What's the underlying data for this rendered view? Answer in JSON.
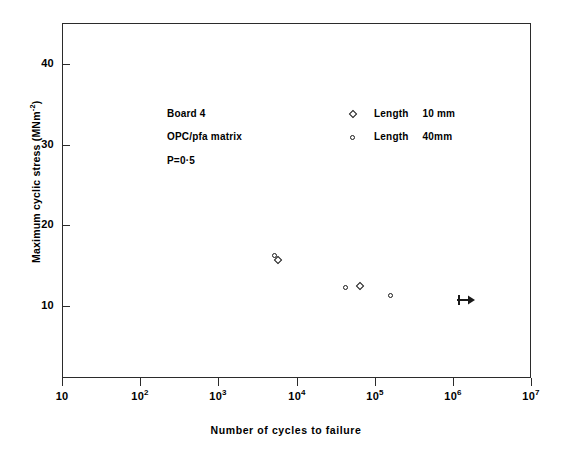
{
  "chart_data": {
    "type": "scatter",
    "title": "",
    "xlabel": "Number of cycles to failure",
    "ylabel": "Maximum cyclic stress (MNm⁻²)",
    "xscale": "log",
    "xlim": [
      10,
      10000000
    ],
    "ylim": [
      5.5,
      45.5
    ],
    "grid": false,
    "xticks": [
      {
        "value": 10,
        "label": "10",
        "mantissa": "10",
        "exponent": ""
      },
      {
        "value": 100,
        "label": "10²",
        "mantissa": "10",
        "exponent": "2"
      },
      {
        "value": 1000,
        "label": "10³",
        "mantissa": "10",
        "exponent": "3"
      },
      {
        "value": 10000,
        "label": "10⁴",
        "mantissa": "10",
        "exponent": "4"
      },
      {
        "value": 100000,
        "label": "10⁵",
        "mantissa": "10",
        "exponent": "5"
      },
      {
        "value": 1000000,
        "label": "10⁶",
        "mantissa": "10",
        "exponent": "6"
      },
      {
        "value": 10000000,
        "label": "10⁷",
        "mantissa": "10",
        "exponent": "7"
      }
    ],
    "yticks": [
      {
        "value": 10,
        "label": "10"
      },
      {
        "value": 20,
        "label": "20"
      },
      {
        "value": 30,
        "label": "30"
      },
      {
        "value": 40,
        "label": "40"
      }
    ],
    "series": [
      {
        "name": "Length 10mm",
        "marker": "diamond",
        "points": [
          {
            "x": 5800,
            "y": 15.7
          },
          {
            "x": 65000,
            "y": 12.5
          }
        ]
      },
      {
        "name": "Length 40mm",
        "marker": "circle",
        "points": [
          {
            "x": 5300,
            "y": 16.3
          },
          {
            "x": 42000,
            "y": 12.3
          },
          {
            "x": 160000,
            "y": 11.3
          }
        ]
      },
      {
        "name": "Run-out",
        "marker": "arrow-right",
        "points": [
          {
            "x": 1400000,
            "y": 10.7
          }
        ]
      }
    ],
    "annotations": [
      {
        "text": "Board 4"
      },
      {
        "text": "OPC/pfa matrix"
      },
      {
        "text": "P=0·5"
      }
    ],
    "legend_position": "upper-center-right",
    "legend": [
      {
        "marker": "diamond",
        "label": "Length",
        "value": "10 mm"
      },
      {
        "marker": "circle",
        "label": "Length",
        "value": "40mm"
      }
    ]
  }
}
